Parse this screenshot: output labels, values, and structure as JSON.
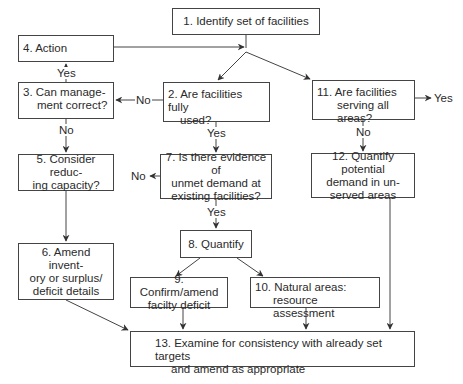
{
  "diagram": {
    "nodes": {
      "n1": {
        "text": "1. Identify set of facilities"
      },
      "n2": {
        "line1": "2. Are facilities fully",
        "line2": "used?"
      },
      "n3": {
        "line1": "3. Can  manage-",
        "line2": "ment correct?"
      },
      "n4": {
        "text": "4.  Action"
      },
      "n5": {
        "line1": "5. Consider reduc-",
        "line2": "ing capacity?"
      },
      "n6": {
        "line1": "6. Amend invent-",
        "line2": "ory or surplus/",
        "line3": "deficit details"
      },
      "n7": {
        "line1": "7. Is there evidence of",
        "line2": "unmet demand at",
        "line3": "existing facilities?"
      },
      "n8": {
        "text": "8. Quantify"
      },
      "n9": {
        "line1": "9. Confirm/amend",
        "line2": "facilty deficit"
      },
      "n10": {
        "line1": "10. Natural areas:",
        "line2": "resource assessment"
      },
      "n11": {
        "line1": "11. Are facilities",
        "line2": "serving all areas?"
      },
      "n12": {
        "line1": "12. Quantify potential",
        "line2": "demand in un-",
        "line3": "served areas"
      },
      "n13": {
        "line1": "13. Examine for consistency with already set targets",
        "line2": "and amend as appropriate"
      }
    },
    "edge_labels": {
      "n3_yes": "Yes",
      "n2_no": "No",
      "n3_no": "No",
      "n2_yes": "Yes",
      "n7_no": "No",
      "n7_yes": "Yes",
      "n11_yes": "Yes",
      "n11_no": "No"
    },
    "edges": [
      {
        "from": "n1",
        "to": "n2"
      },
      {
        "from": "n1",
        "to": "n11"
      },
      {
        "from": "n4",
        "to": "n1"
      },
      {
        "from": "n2",
        "to": "n3",
        "label": "No"
      },
      {
        "from": "n2",
        "to": "n7",
        "label": "Yes"
      },
      {
        "from": "n3",
        "to": "n4",
        "label": "Yes"
      },
      {
        "from": "n3",
        "to": "n5",
        "label": "No"
      },
      {
        "from": "n5",
        "to": "n6"
      },
      {
        "from": "n6",
        "to": "n13"
      },
      {
        "from": "n7",
        "to": "n8",
        "label": "Yes"
      },
      {
        "from": "n7",
        "to": "exit",
        "label": "No"
      },
      {
        "from": "n8",
        "to": "n9"
      },
      {
        "from": "n8",
        "to": "n10"
      },
      {
        "from": "n9",
        "to": "n13"
      },
      {
        "from": "n10",
        "to": "n13"
      },
      {
        "from": "n11",
        "to": "n12",
        "label": "No"
      },
      {
        "from": "n11",
        "to": "exit",
        "label": "Yes"
      },
      {
        "from": "n12",
        "to": "n13"
      }
    ]
  }
}
